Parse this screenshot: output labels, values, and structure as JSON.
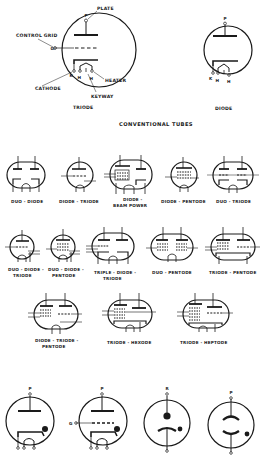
{
  "diagram": {
    "section_title": "CONVENTIONAL TUBES",
    "triode_callouts": {
      "plate": "PLATE",
      "control_grid": "CONTROL GRID",
      "cathode": "CATHODE",
      "heater": "HEATER",
      "keyway": "KEYWAY",
      "pin_p": "P",
      "pin_g": "G",
      "pin_k": "K",
      "pin_h1": "H",
      "pin_h2": "H"
    },
    "diode_pins": {
      "p": "P",
      "k": "K",
      "h1": "H",
      "h2": "H"
    },
    "top_labels": {
      "triode": "TRIODE",
      "diode": "DIODE"
    },
    "row1": [
      {
        "label": "DUO - DIODE"
      },
      {
        "label": "DIODE - TRIODE"
      },
      {
        "label_line1": "DIODE -",
        "label_line2": "BEAM POWER"
      },
      {
        "label": "DIODE - PENTODE"
      },
      {
        "label": "DUO - TRIODE"
      }
    ],
    "row2": [
      {
        "label_line1": "DUO - DIODE -",
        "label_line2": "TRIODE"
      },
      {
        "label_line1": "DUO - DIODE -",
        "label_line2": "PENTODE"
      },
      {
        "label_line1": "TRIPLE - DIODE -",
        "label_line2": "TRIODE"
      },
      {
        "label": "DUO - PENTODE"
      },
      {
        "label": "TRIODE - PENTODE"
      }
    ],
    "row3": [
      {
        "label_line1": "DIODE - TRIODE -",
        "label_line2": "PENTODE"
      },
      {
        "label": "TRIODE - HEXODE"
      },
      {
        "label": "TRIODE - HEPTODE"
      }
    ],
    "row4_pins": {
      "gas_diode_p": "P",
      "gas_triode_p": "P",
      "gas_triode_g": "G",
      "cold_cathode_top": "R",
      "cold_cathode_p": "P"
    },
    "colors": {
      "ink": "#1a1a1a",
      "background": "#ffffff"
    }
  }
}
